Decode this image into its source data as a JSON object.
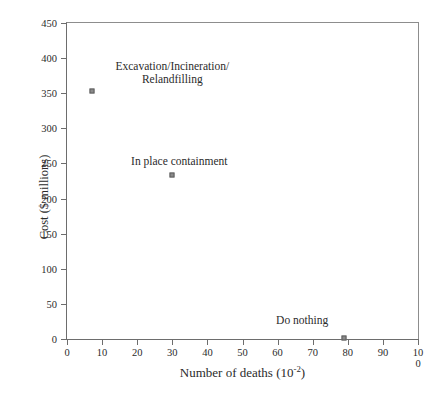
{
  "chart_data": {
    "type": "scatter",
    "title": "",
    "xlabel": "Number of deaths (10",
    "xlabel_exponent": "-2",
    "xlabel_suffix": ")",
    "ylabel": "Cost ($ millions)",
    "xlim": [
      0,
      100
    ],
    "ylim": [
      0,
      450
    ],
    "xticks": [
      0,
      10,
      20,
      30,
      40,
      50,
      60,
      70,
      80,
      90,
      100
    ],
    "xtick_labels": [
      "0",
      "10",
      "20",
      "30",
      "40",
      "50",
      "60",
      "70",
      "80",
      "90",
      "100"
    ],
    "yticks": [
      0,
      50,
      100,
      150,
      200,
      250,
      300,
      350,
      400,
      450
    ],
    "ytick_labels": [
      "0",
      "50",
      "100",
      "150",
      "200",
      "250",
      "300",
      "350",
      "400",
      "450"
    ],
    "grid": false,
    "legend": "none",
    "marker_color": "#8a8a8a",
    "marker_edge_color": "#5e5e5e",
    "axis_color": "#6d6d6d",
    "points": [
      {
        "label": "Excavation/Incineration/\nRelandfilling",
        "x": 7,
        "y": 353,
        "label_x": 30,
        "label_y": 398
      },
      {
        "label": "In place containment",
        "x": 30,
        "y": 233,
        "label_x": 32,
        "label_y": 262
      },
      {
        "label": "Do nothing",
        "x": 79,
        "y": 2,
        "label_x": 67,
        "label_y": 35
      }
    ]
  }
}
